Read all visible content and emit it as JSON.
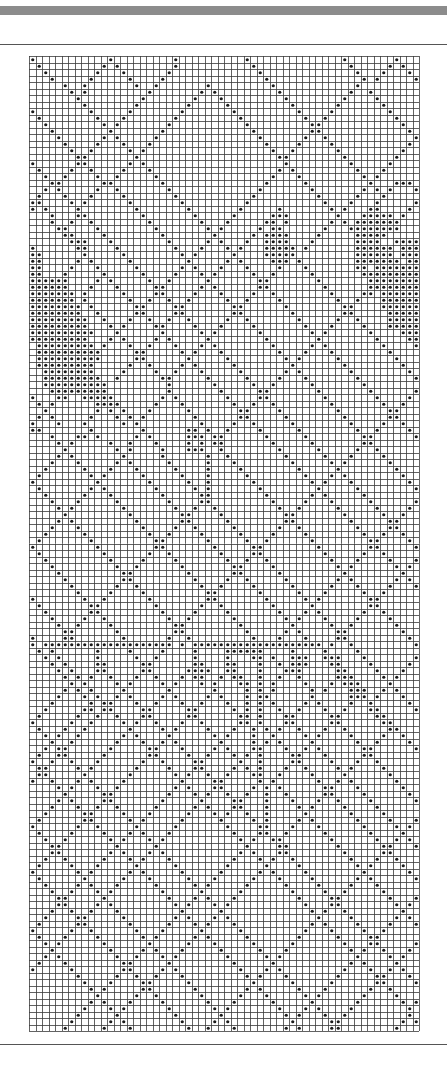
{
  "page": {
    "header_bar_color": "#8c8c8c",
    "rule_color": "#555555"
  },
  "grid": {
    "columns": 60,
    "rows": 150,
    "cell_size_px": 6.5,
    "line_color": "#3a3a3a",
    "dot_color": "#1a1a1a",
    "background": "#ffffff",
    "legend": "each dot marks a filled cell",
    "pattern_rows": [
      "#...........#.........#..........#..............#.......#....",
      ".#.........#.#........#...........#..............#.....#.#...",
      "..#.......#...#......#.............#..............#...#...#..",
      "...#.....#.....#....#...............#..............#.#.....#.",
      ".....#..#.......#..#.......#.........#............#..........",
      "......#.#.........#.......#.#.........#..........#..#........",
      ".......#.........#.......#...#.........#........#....#.......",
      "........#.......#.......#.....#.........#......#......#......",
      "#........#.....#.......#.......#.........#....#........#.....",
      ".#........#...#.......#.........#.........#..#..........#....",
      "..#........#.#.......#...........#.........##............#...",
      "...#........#.......#.............#........##.............#..",
      "....#......#.#.....#...............#......#..#.............#.",
      ".....#....#...#...#.................#....#....#...........#..",
      "......#..#.....#.#...................#..#......#.........#...",
      ".......##.......#.....................##........#.......#....",
      "#......##......#.#.....................#.........#.....#.....",
      ".#....#..#....#...#...................#.#.........#...#......",
      "..#..#....#..#.....#.................#...#.........#.#.......",
      "...##......##.......#...............#.....#.........#...###..",
      "..#.#.....#..#.......#.............#.......#.......#.#.#...#.",
      ".#...#...#....#.......#...........#.........#.....#...#.....#",
      "##....#.#......#.......#.........#...........#...#...#.....#.",
      "#.#....#........#.......#.......#.....#.......#.#...##....#..",
      "...#...##........#.......#.....#.....###.......#...#####.#...",
      "...#..#..#........#.......#...#.....##.#......#.#.#######....",
      "....##....#........#.......#.#.....#.##......#...########....",
      ".....##....#........#.......#.....#.####....#.....#####......",
      "......###...#........#.....#.#...#..####...#......####..#####",
      "#......##....#........#...#...#.#...#####.#.......######.####",
      "##......#.....#........#.#.....#....#####.........######.####",
      "##.....#.#.....#........#.....#.#....###.#........#######.###",
      "##....#...#.....#......#.#...#...#....#...#.......##.########",
      "##...#.....#.....#....#...#.#.....#..#.....#.......##########",
      "######....#.#.....#..#.....#.......##.......#.......#########",
      "######...#...#.....##.....#.#......##........#......#########",
      "#######.#.....#....##....#...#....#..#........#....##.#######",
      "#######.#......#..#..#..#.....#..#....#........#..#...#######",
      "########.#......##....##.......##......#........##....#######",
      "########..#.....##....##.......##.......#.......##.....######",
      "#########..#...#..#..#..#.....#..#.......#.....#..#....######",
      "#########...#.#....##....#...#....#.......#...#....#...######",
      "##########...#......#.....#.#......#.......#.#......#....####",
      "#########...#.#....#.#.....#........#.......#........#....###",
      ".#########.#...#..#...#...#.#........#.....#.#........#....##",
      ".##########.....##.....#.#...#........#...#...#........#....#",
      ".##########.....##......#.....#........#.#.....#........#...#",
      ".#########.....#..#....#.#.....#........#.......#........#..#",
      "..########....#....#..#...#.....#......#.#.......#........#.#",
      "..#########..#......##.....#.....#....#...#.......#........##",
      "..##########.........#......#.....#..#.....#.......#........#",
      "...#########.........#.......#.....##.......#.......#......#.",
      "#...##..#####.......#.#.......#....##........#.......#....#..",
      ".#.#......####.....#...#.......#..#..#........#.......#..#...",
      "..#.......#.#.#...#.....#.......##....#........#.......##....",
      ".#.#.....#...#.#.#.......#......##.....#........#......##....",
      "#...#...#.....#.#.........#....#..#.....#........#....#..#...",
      "##.......#.......#......##.#..#....#.....#........#..#....#..",
      "...#...##.#.....#.#.....###.##......#.....#........##......#.",
      "....#.#.....#..#...#....#.#.##.......#.....#.......##.......#",
      ".....#.......#.#....#...###..#........#.....#.....#..#.......",
      "....#.#.......#.....#......#..#........#.....#...#....#......",
      "...#...#.....#.#.....#.....#...#........#.....#.#......#.....",
      "..#.....#...#...#.....#....#....#........#.....#........#....",
      ".#.......#.#.....#.....#...#.....#........#...#.#........#...",
      "#.........#.......#.....#..#......#........#.#...#........#..",
      ".#.......#.#.......#.....#.#.......#........#.....#........#.",
      "..#.....#...#.......#.....##........#......#.#.....#........#",
      "...#...#.....#.......#....##.........#....#...#.....#......#.",
      "....#.#.......#.......#..#..#.........#..#.....#.....#....#..",
      ".....#.........#.......##....#.........##.......#.....#..#...",
      "....#.#.........#......##.....#........##........#.....##....",
      "...#...#.........#....#..#.....#......#..#........#....##....",
      "..#.....#.........#..#....#.....#....#....#........#..#..#...",
      ".#.......#.........##......#.....#..#......#........##....#..",
      "#.........#........##.......#.....##........#.......##.....#.",
      ".#.........#......#..#.......#....##.........#.....#..#.....#",
      "..#.........#....#....#.......#..#..#.........#...#....#...#.",
      "...#.........#..#......#.......##....#.........#.#......#.#..",
      "....#.........##........#......##.....#.........#........#...",
      ".....#........##.........#....#..#.....#.......#.#......#.#..",
      "......#......#..#.........#..#....#.....#.....#...#....#...#.",
      ".......#....#....#.........##......#.....#...#.....#..#.....#",
      "#.......#..#......#........##.......#.....#.#.......##.......",
      ".#.......##........#......#..#.......#.....#........##.......",
      "..#......##.........#....#....#.......#...#.#......#..#......",
      "...#....#..#.........#..#......#.......#.#...#....#....#.....",
      "....#..#....#.........##........#.......#.....#..#......#....",
      ".....##......#........##.........#.....#.#.....##........#...",
      "#....##.......#......#..#.........#...#...#....##.........#..",
      "#.####################.#.####################.#..#.........#.",
      ".#.#......#....#....#....#....######....#....#....#.........#",
      "..#.#.....#.....#..#.....#....#...##.#..###..###...#.......#.",
      "...#.#....##.....##......##...##...#..#.###...##....#.....#..",
      "....#.#...##.....##.....####..##...#...###.....##....#...#...",
      ".....#.#.#..#...#..#...#.##..#.##..#..#..#.....###....#.#....",
      "......#.#....#.#....#.#...#.#...##.#.#....#...#.###....#.....",
      ".....#.#.#....#......#......#....#.#.#.....#.#...###..#.#....",
      "....#...#.#..#.#....#.#....#.#...#.##......#.....###.#...#...",
      "...#.....#.##...#..#...#..#...#..#.#.#....#.#....#..#.....#..",
      "..#.....##.##....##.....##.....#.#.#..#..#...#..#...##.....#.",
      ".#.....#..#..#...##.....##......##.#...##.....##.....##.....#",
      "#.....#..#....#.#..#...#..#.....##.#...##.....##......##.....",
      ".#...#..#......#....#.#....#...#..#.#.#..#...#..#......##....",
      "..#.#..#......#.#....#......#.#...#..#....#.#....#....#..#...",
      "...#..#......#...#..#.#......#....#.#.#....#......#..#....#..",
      "..#.##......#.....##...#....#.#...##...#..#.#......##......#.",
      ".#..##.....#......##....#..#...#.#.#....##...#.....##.......#",
      "#..#..#...#......#..#....##.....#..#....##....#...#..#.......",
      ".##....#.#......#....#...##....#.#.#...#..#....#.#....#......",
      ".##.....#......#......#.#..#..#...##..#....#....#......#.....",
      "#..#...#.#....#........#....##.....#.#......#..#.#......#....",
      "....#.#...#..#........#.#...##....#.#.#......##...#......#...",
      ".....#.....##........#...#.#..#..#..#..#.....##....#......#..",
      "....#.#....##.......#.....#....##...#...#...#..#....#......#.",
      "...#...#..#..#.....#.....#.#...##...#....#.#....#....#......#",
      "..#.....##....#...#.....#...#.#..#..#.....#......#....#.....#",
      ".#......##.....#.#.....#.....#....#.#....#.#......#....#...#.",
      "#......#..#.....#.....#.......#....##...#...#......#....#.#..",
      ".#....#....#...#.#...#.........#...##..#.....#......#....#...",
      "..#..#......#.#...#.#...........#.#..##.......#......#..#.#..",
      "...##........#.....#.............#....##.......#......##...#.",
      "...##.......#.#...#.#...........#.#...##........#.....##....#",
      "..#..#.....#...#.#...#.........#...#.#..#........#...#..#....",
      ".#....#...#.....#.....#.......#.....#....#........#.#....#...",
      "#......#.#.....#.#.....#.....#.....#.#....#........#......#..",
      ".#......#.....#...#.....#...#.....#...#....#......#.#......#.",
      "..#....#.#...#.....#.....#.#.....#.....#....#....#...#......#",
      "...#..#...#.#.......#.....#.....#.......#....#..#.....#.....#",
      "....##.....#.........#...#.#...#.........#....##.......#...#.",
      "....##....#.#.........#.#...#.#...........#...##........#.#..",
      "...#..#..#...#.........#.....#.............#.#..#........#...",
      "..#....##.....#.......#.#...#.#.............#....#......#.#..",
      ".#.....##......#.....#...#.#...#...........#.#....#....#...#.",
      "#.....#..#......#...#.....#.....#.........#...#....#..#.....#",
      ".#...#....#......#.#.....#.#.....#.......#.....#....##......#",
      "..#.#......#......#.....#...#.....#.....#.......#...##.....#.",
      "...#........#....#.#...#.....#.....#...#.........#.#..#...#..",
      "..#.#........#..#...#.#.......#.....#.#...........#....#.#...",
      ".#...#........##.....#.........#.....#...........#.#....#....",
      "#.....#.......##....#.#.........#...#.#.........#...#..#.#...",
      ".......#.....#..#..#...#.........#.#...#.......#.....##...#..",
      "........#...#....##.....#.........#.....#.....#......##....#.",
      ".........#.#.....##......#.......#.#.....#...#......#..#....#",
      "..........#.....#..#......#.....#...#.....#.#......#....#...#",
      ".........#.#...#....#......#...#.....#.....#......#......#.#.",
      "........#...#.#......#......#.#.......#...#.#....#........#..",
      ".......#.....#........#......#.........#.#...#..#.........#..",
      "......#.....#.#........#....#.#.........#.....##.........#.#.",
      ".....#.....#...#........#..#...#.......#.#....##........#...#"
    ]
  }
}
